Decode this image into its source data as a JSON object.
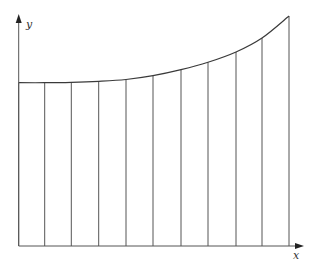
{
  "figure": {
    "axis_labels": {
      "x": "x",
      "y": "y"
    },
    "colors": {
      "stroke": "#555555",
      "curve": "#3a3a3a",
      "background": "#ffffff"
    },
    "axes": {
      "origin": [
        18.7,
        246
      ],
      "x_end": 304,
      "y_end": 14
    },
    "strips": {
      "count": 10,
      "x_positions": [
        18.7,
        44.7,
        71.3,
        98.7,
        126,
        153,
        181,
        208,
        236,
        262,
        289
      ]
    },
    "curve_points": [
      [
        18.7,
        82.7
      ],
      [
        44.7,
        82.7
      ],
      [
        71.3,
        82.3
      ],
      [
        98.7,
        81.3
      ],
      [
        126,
        79.5
      ],
      [
        153,
        75.7
      ],
      [
        181,
        69.7
      ],
      [
        208,
        62.3
      ],
      [
        236,
        52
      ],
      [
        262,
        38
      ],
      [
        289,
        16
      ]
    ]
  }
}
